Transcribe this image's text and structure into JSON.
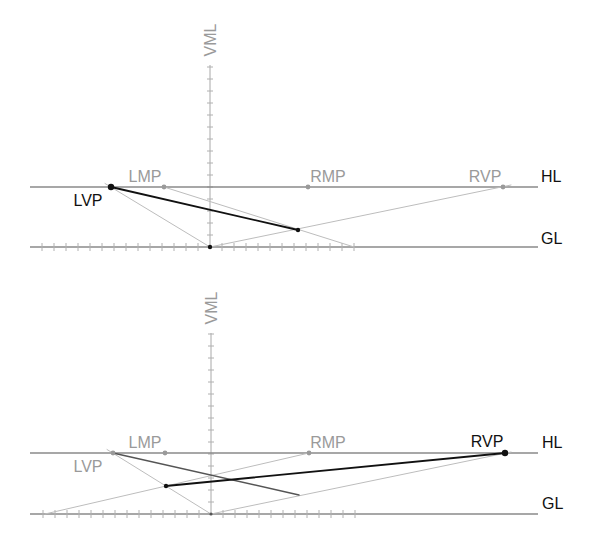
{
  "diagram": {
    "colors": {
      "background": "#ffffff",
      "reference_line": "#8a8a8a",
      "construction_line": "#bdbdbd",
      "dark_line": "#555555",
      "emphasis_line": "#111111",
      "label_gray": "#9a9a9a",
      "label_black": "#111111"
    },
    "panels": [
      {
        "id": "top",
        "labels": {
          "vml": "VML",
          "hl": "HL",
          "gl": "GL",
          "lmp": "LMP",
          "rmp": "RMP",
          "lvp": "LVP",
          "rvp": "RVP"
        },
        "active_vanishing_point": "LVP",
        "vml": {
          "x": 210,
          "y1": 65,
          "y2": 247,
          "tick_spacing": 12,
          "tick_count": 15
        },
        "hl": {
          "y": 187,
          "x1": 30,
          "x2": 538
        },
        "gl": {
          "y": 247,
          "x1": 30,
          "x2": 538,
          "tick_spacing": 12,
          "ticks_left": 14,
          "ticks_right": 12
        },
        "points": [
          {
            "name": "lvp-point",
            "x": 111,
            "y": 187,
            "r": 3.2,
            "color": "#111111"
          },
          {
            "name": "lmp-point",
            "x": 164,
            "y": 187,
            "r": 2.4,
            "color": "#9a9a9a"
          },
          {
            "name": "rmp-point",
            "x": 308,
            "y": 187,
            "r": 2.4,
            "color": "#9a9a9a"
          },
          {
            "name": "rvp-point",
            "x": 503,
            "y": 187,
            "r": 2.4,
            "color": "#9a9a9a"
          },
          {
            "name": "origin-point",
            "x": 210,
            "y": 247,
            "r": 2.2,
            "color": "#111111"
          },
          {
            "name": "measured-point",
            "x": 298,
            "y": 230,
            "r": 2.2,
            "color": "#111111"
          }
        ],
        "lines": [
          {
            "name": "lvp-to-origin-line",
            "x1": 105,
            "y1": 183.5,
            "x2": 210,
            "y2": 247,
            "color": "#bdbdbd",
            "width": 1
          },
          {
            "name": "lmp-measure-line",
            "x1": 164,
            "y1": 187,
            "x2": 354,
            "y2": 247,
            "color": "#bdbdbd",
            "width": 1
          },
          {
            "name": "origin-to-rvp-line",
            "x1": 210,
            "y1": 247,
            "x2": 511,
            "y2": 185,
            "color": "#bdbdbd",
            "width": 1
          },
          {
            "name": "lvp-depth-line",
            "x1": 111,
            "y1": 187,
            "x2": 298,
            "y2": 230,
            "color": "#111111",
            "width": 1.8
          }
        ],
        "label_pos": {
          "vml": {
            "x": 210,
            "y": 40
          },
          "lmp": {
            "x": 145,
            "y": 176
          },
          "rmp": {
            "x": 328,
            "y": 176
          },
          "rvp": {
            "x": 485,
            "y": 176
          },
          "lvp": {
            "x": 88,
            "y": 200
          },
          "hl": {
            "x": 541,
            "y": 176
          },
          "gl": {
            "x": 541,
            "y": 238
          }
        },
        "label_colors": {
          "lvp": "black",
          "rvp": "gray"
        }
      },
      {
        "id": "bottom",
        "labels": {
          "vml": "VML",
          "hl": "HL",
          "gl": "GL",
          "lmp": "LMP",
          "rmp": "RMP",
          "lvp": "LVP",
          "rvp": "RVP"
        },
        "active_vanishing_point": "RVP",
        "vml": {
          "x": 211,
          "y1": 333,
          "y2": 514,
          "tick_spacing": 12,
          "tick_count": 15
        },
        "hl": {
          "y": 453,
          "x1": 30,
          "x2": 538
        },
        "gl": {
          "y": 514,
          "x1": 30,
          "x2": 538,
          "tick_spacing": 12,
          "ticks_left": 14,
          "ticks_right": 12
        },
        "points": [
          {
            "name": "lvp-point",
            "x": 113,
            "y": 453,
            "r": 2.4,
            "color": "#9a9a9a"
          },
          {
            "name": "lmp-point",
            "x": 165,
            "y": 453,
            "r": 2.4,
            "color": "#9a9a9a"
          },
          {
            "name": "rmp-point",
            "x": 309,
            "y": 453,
            "r": 2.4,
            "color": "#9a9a9a"
          },
          {
            "name": "rvp-point",
            "x": 505,
            "y": 453,
            "r": 3.2,
            "color": "#111111"
          },
          {
            "name": "origin-point",
            "x": 211,
            "y": 514,
            "r": 1.6,
            "color": "#555555"
          },
          {
            "name": "measured-point",
            "x": 166,
            "y": 486,
            "r": 2.2,
            "color": "#111111"
          }
        ],
        "lines": [
          {
            "name": "lvp-to-origin-line",
            "x1": 107,
            "y1": 449.5,
            "x2": 211,
            "y2": 514,
            "color": "#bdbdbd",
            "width": 1
          },
          {
            "name": "rmp-measure-line",
            "x1": 45,
            "y1": 514,
            "x2": 309,
            "y2": 453,
            "color": "#bdbdbd",
            "width": 1
          },
          {
            "name": "origin-to-rvp-line",
            "x1": 211,
            "y1": 514,
            "x2": 511,
            "y2": 452,
            "color": "#bdbdbd",
            "width": 1
          },
          {
            "name": "lvp-depth-line",
            "x1": 113,
            "y1": 453,
            "x2": 299,
            "y2": 495,
            "color": "#555555",
            "width": 1.4
          },
          {
            "name": "rvp-depth-line",
            "x1": 166,
            "y1": 486,
            "x2": 505,
            "y2": 453,
            "color": "#111111",
            "width": 1.8
          }
        ],
        "label_pos": {
          "vml": {
            "x": 211,
            "y": 308
          },
          "lmp": {
            "x": 145,
            "y": 442
          },
          "rmp": {
            "x": 328,
            "y": 442
          },
          "rvp": {
            "x": 487,
            "y": 441
          },
          "lvp": {
            "x": 88,
            "y": 466
          },
          "hl": {
            "x": 542,
            "y": 442
          },
          "gl": {
            "x": 542,
            "y": 503
          }
        },
        "label_colors": {
          "lvp": "gray",
          "rvp": "black"
        }
      }
    ]
  }
}
